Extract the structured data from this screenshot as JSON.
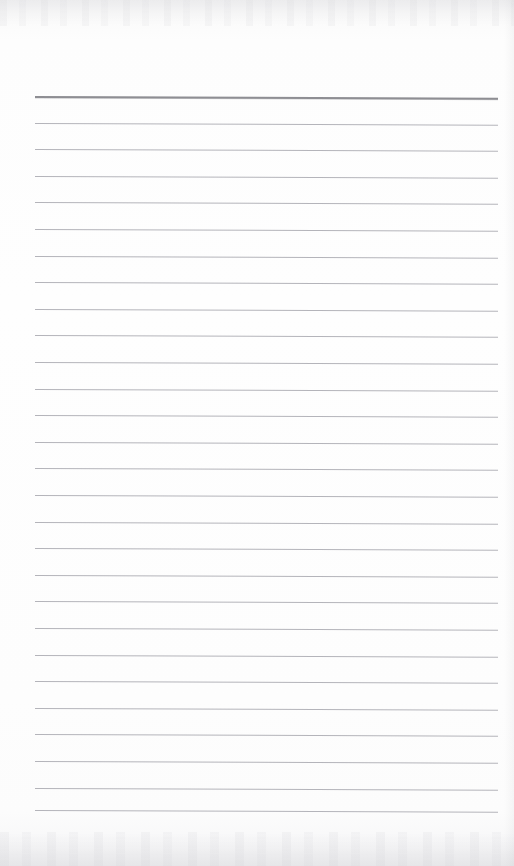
{
  "document": {
    "kind": "ruled-notepad-page",
    "title": "Blank ruled notepad page",
    "content_text": "",
    "visible_text": "",
    "page_width": 514,
    "page_height": 866,
    "background_color": "#fdfdfd",
    "paper_tone": "off-white scanned paper"
  },
  "ruling": {
    "line_count": 28,
    "header_rule_count": 1,
    "body_rule_count": 27,
    "line_spacing_px": 26.6,
    "first_line_y": 96,
    "last_line_y": 810,
    "left_margin_x": 35,
    "right_margin_x": 498,
    "line_length_px": 463,
    "tilt_degrees": 0.22,
    "header_color": "#8e8e93",
    "body_color": "#b4b4ba",
    "header_thickness_px": 2,
    "body_thickness_px": 1
  },
  "lines": [
    {
      "index": 0,
      "y": 96,
      "type": "header"
    },
    {
      "index": 1,
      "y": 122.6,
      "type": "body"
    },
    {
      "index": 2,
      "y": 149.2,
      "type": "body"
    },
    {
      "index": 3,
      "y": 175.8,
      "type": "body"
    },
    {
      "index": 4,
      "y": 202.4,
      "type": "body"
    },
    {
      "index": 5,
      "y": 229.0,
      "type": "body"
    },
    {
      "index": 6,
      "y": 255.6,
      "type": "body"
    },
    {
      "index": 7,
      "y": 282.2,
      "type": "body"
    },
    {
      "index": 8,
      "y": 308.8,
      "type": "body"
    },
    {
      "index": 9,
      "y": 335.4,
      "type": "body"
    },
    {
      "index": 10,
      "y": 362.0,
      "type": "body"
    },
    {
      "index": 11,
      "y": 388.6,
      "type": "body"
    },
    {
      "index": 12,
      "y": 415.2,
      "type": "body"
    },
    {
      "index": 13,
      "y": 441.8,
      "type": "body"
    },
    {
      "index": 14,
      "y": 468.4,
      "type": "body"
    },
    {
      "index": 15,
      "y": 495.0,
      "type": "body"
    },
    {
      "index": 16,
      "y": 521.6,
      "type": "body"
    },
    {
      "index": 17,
      "y": 548.2,
      "type": "body"
    },
    {
      "index": 18,
      "y": 574.8,
      "type": "body"
    },
    {
      "index": 19,
      "y": 601.4,
      "type": "body"
    },
    {
      "index": 20,
      "y": 628.0,
      "type": "body"
    },
    {
      "index": 21,
      "y": 654.6,
      "type": "body"
    },
    {
      "index": 22,
      "y": 681.2,
      "type": "body"
    },
    {
      "index": 23,
      "y": 707.8,
      "type": "body"
    },
    {
      "index": 24,
      "y": 734.4,
      "type": "body"
    },
    {
      "index": 25,
      "y": 761.0,
      "type": "body"
    },
    {
      "index": 26,
      "y": 787.6,
      "type": "body"
    },
    {
      "index": 27,
      "y": 810.0,
      "type": "body"
    }
  ],
  "artifacts": {
    "top_noise_band": "faint gray scanner speckle",
    "bottom_noise_band": "faint gray scanner speckle",
    "right_edge_shading": "soft gray edge falloff"
  }
}
